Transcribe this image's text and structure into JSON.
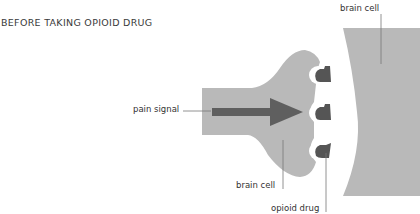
{
  "title": "BEFORE TAKING OPIOID DRUG",
  "labels": {
    "pain_signal": "pain signal",
    "brain_cell_sender": "brain cell",
    "brain_cell_receiver": "brain cell",
    "opioid_drug": "opioid drug"
  },
  "colors": {
    "cell_fill": "#b9b9b9",
    "arrow_fill": "#5f5f5f",
    "receptor_fill": "#555555",
    "leader_line": "#777777"
  }
}
